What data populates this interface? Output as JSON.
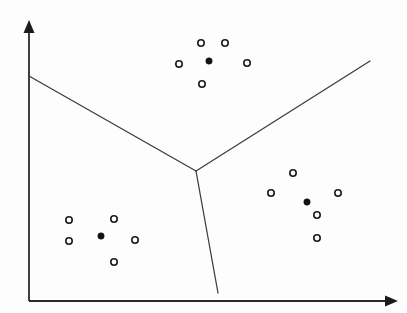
{
  "figure": {
    "background_color": "#fdfdfd",
    "width": 407,
    "height": 313,
    "line_color": "#3b3b3b",
    "axis_color": "#2a2a2a",
    "point_stroke_color": "#1a1a1a",
    "point_fill_color": "#fefefe",
    "centroid_color": "#121212"
  },
  "axes": {
    "origin": {
      "x": 29,
      "y": 301
    },
    "x_axis": {
      "label": "",
      "start": {
        "x": 29,
        "y": 301
      },
      "end": {
        "x": 393,
        "y": 301
      },
      "arrow_tip": {
        "x": 398,
        "y": 301
      },
      "arrow_half_height": 5.5,
      "arrow_length": 13
    },
    "y_axis": {
      "label": "",
      "start": {
        "x": 29,
        "y": 301
      },
      "end": {
        "x": 29,
        "y": 27
      },
      "arrow_tip": {
        "x": 29,
        "y": 20
      },
      "arrow_half_height": 5.5,
      "arrow_length": 13
    }
  },
  "chart_data": {
    "type": "scatter",
    "xlabel": "",
    "ylabel": "",
    "xlim": [
      0,
      407
    ],
    "ylim": [
      0,
      313
    ],
    "grid": false,
    "legend": "none",
    "point_radius": 4,
    "centroid_radius": 3.2,
    "series": [
      {
        "name": "cluster-top",
        "marker": "open-circle",
        "centroid": {
          "x": 209,
          "y": 61
        },
        "points": [
          {
            "x": 201,
            "y": 43
          },
          {
            "x": 225,
            "y": 43
          },
          {
            "x": 179,
            "y": 64
          },
          {
            "x": 247,
            "y": 63
          },
          {
            "x": 202,
            "y": 84
          }
        ]
      },
      {
        "name": "cluster-bottom-left",
        "marker": "open-circle",
        "centroid": {
          "x": 101,
          "y": 236
        },
        "points": [
          {
            "x": 69,
            "y": 220
          },
          {
            "x": 114,
            "y": 219
          },
          {
            "x": 69,
            "y": 241
          },
          {
            "x": 135,
            "y": 240
          },
          {
            "x": 114,
            "y": 262
          }
        ]
      },
      {
        "name": "cluster-bottom-right",
        "marker": "open-circle",
        "centroid": {
          "x": 307,
          "y": 202
        },
        "points": [
          {
            "x": 293,
            "y": 173
          },
          {
            "x": 271,
            "y": 193
          },
          {
            "x": 338,
            "y": 193
          },
          {
            "x": 317,
            "y": 215
          },
          {
            "x": 317,
            "y": 238
          }
        ]
      }
    ],
    "boundaries": [
      {
        "name": "boundary-upper-left",
        "from": {
          "x": 29,
          "y": 76
        },
        "to": {
          "x": 196,
          "y": 171
        }
      },
      {
        "name": "boundary-upper-right",
        "from": {
          "x": 196,
          "y": 171
        },
        "to": {
          "x": 370,
          "y": 61
        }
      },
      {
        "name": "boundary-lower",
        "from": {
          "x": 196,
          "y": 171
        },
        "to": {
          "x": 218,
          "y": 293
        }
      }
    ],
    "junction": {
      "x": 196,
      "y": 171
    }
  }
}
